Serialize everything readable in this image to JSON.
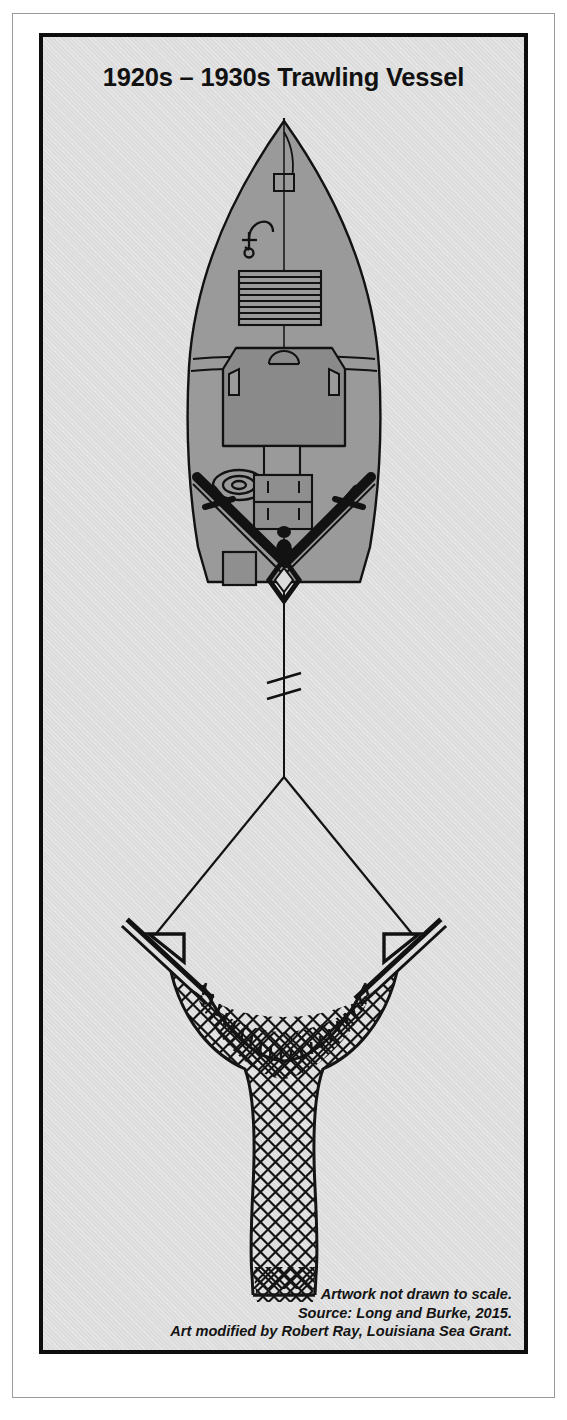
{
  "figure": {
    "title": "1920s – 1930s Trawling Vessel",
    "caption_lines": [
      "Artwork not drawn to scale.",
      "Source: Long and Burke, 2015.",
      "Art modified by Robert Ray, Louisiana Sea Grant."
    ],
    "colors": {
      "page_background": "#ffffff",
      "plate_background": "#dcdcdc",
      "frame_border": "#0d0d0d",
      "outer_hairline": "#9a9a9a",
      "hull_fill": "#9a9a9a",
      "deckhouse_fill": "#8a8a8a",
      "hatch_fill": "#8f8f8f",
      "line_stroke": "#121212",
      "title_text": "#111111",
      "caption_text": "#141414"
    },
    "diagram": {
      "type": "technical-illustration",
      "view": "plan-view",
      "subject": "shrimp trawling vessel towing an otter trawl net",
      "parts": [
        {
          "name": "mast",
          "label": "mast-and-antenna"
        },
        {
          "name": "anchor",
          "label": "anchor-symbol"
        },
        {
          "name": "bow-hatch",
          "label": "slatted-bow-hatch"
        },
        {
          "name": "deckhouse",
          "label": "wheelhouse-cabin"
        },
        {
          "name": "cabin-windows",
          "label": "side-windows"
        },
        {
          "name": "engine-box",
          "label": "engine-housing"
        },
        {
          "name": "deck-hatches",
          "label": "fish-hold-hatches"
        },
        {
          "name": "coiled-rope",
          "label": "coiled-line"
        },
        {
          "name": "outrigger-booms",
          "label": "port-and-starboard-booms"
        },
        {
          "name": "stern-winch",
          "label": "stern-block"
        },
        {
          "name": "stern-hatch",
          "label": "stern-deck-hatch"
        },
        {
          "name": "tow-cable",
          "label": "tow-cable-with-break-symbol"
        },
        {
          "name": "break-symbol",
          "label": "not-to-scale-break"
        },
        {
          "name": "bridle-lines",
          "label": "trawl-bridles"
        },
        {
          "name": "otter-board-port",
          "label": "port-otter-door"
        },
        {
          "name": "otter-board-starboard",
          "label": "starboard-otter-door"
        },
        {
          "name": "headrope",
          "label": "headrope-with-lacing"
        },
        {
          "name": "net-body",
          "label": "diamond-mesh-net-body"
        },
        {
          "name": "cod-end",
          "label": "cod-end-bag"
        }
      ]
    }
  }
}
